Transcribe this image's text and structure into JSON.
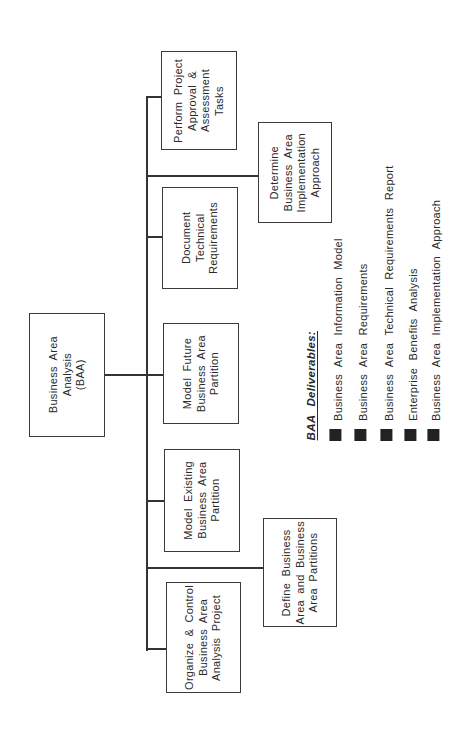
{
  "diagram": {
    "root": {
      "lines": [
        "Business  Area",
        "Analysis",
        "(BAA)"
      ]
    },
    "tasks": {
      "perform": {
        "lines": [
          "Perform  Project",
          "Approval  &",
          "Assessment",
          "Tasks"
        ]
      },
      "determine": {
        "lines": [
          "Determine",
          "Business  Area",
          "Implementation",
          "Approach"
        ]
      },
      "document": {
        "lines": [
          "Document",
          "Technical",
          "Requirements"
        ]
      },
      "model_future": {
        "lines": [
          "Model Future",
          "Business  Area",
          "Partition"
        ]
      },
      "model_existing": {
        "lines": [
          "Model  Existing",
          "Business  Area",
          "Partition"
        ]
      },
      "define": {
        "lines": [
          "Define  Business",
          "Area and Business",
          "Area   Partitions"
        ]
      },
      "organize": {
        "lines": [
          "Organize  &  Control",
          "Business  Area",
          "Analysis   Project"
        ]
      }
    },
    "deliverables": {
      "title": "BAA  Deliverables:",
      "items": [
        "Business  Area  Information  Model",
        "Business  Area  Requirements",
        "Business  Area  Technical  Requirements  Report",
        "Enterprise  Benefits  Analysis",
        "Business  Area  Implementation  Approach"
      ],
      "bullet_color": "#222222"
    }
  }
}
